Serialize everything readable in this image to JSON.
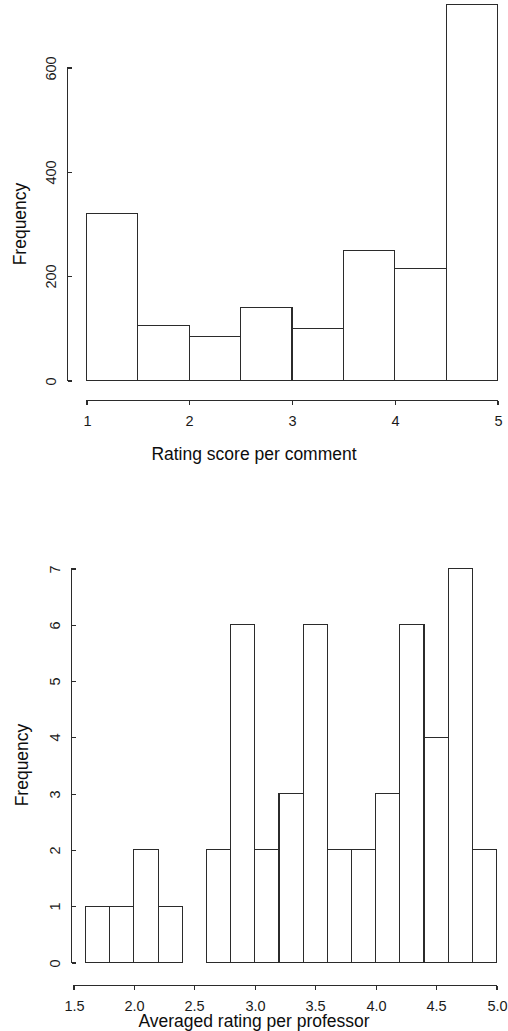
{
  "chart_data": [
    {
      "type": "bar",
      "subtype": "histogram",
      "id": "rating-score-per-comment",
      "title": "",
      "xlabel": "Rating score per comment",
      "ylabel": "Frequency",
      "xlim": [
        1,
        5
      ],
      "ylim": [
        0,
        720
      ],
      "xticks": [
        "1",
        "2",
        "3",
        "4",
        "5"
      ],
      "xtick_values": [
        1,
        2,
        3,
        4,
        5
      ],
      "yticks": [
        "0",
        "200",
        "400",
        "600"
      ],
      "ytick_values": [
        0,
        200,
        400,
        600
      ],
      "grid": false,
      "legend": null,
      "bin_width": 0.5,
      "bin_edges": [
        1.0,
        1.5,
        2.0,
        2.5,
        3.0,
        3.5,
        4.0,
        4.5,
        5.0
      ],
      "categories": [
        "1.0-1.5",
        "1.5-2.0",
        "2.0-2.5",
        "2.5-3.0",
        "3.0-3.5",
        "3.5-4.0",
        "4.0-4.5",
        "4.5-5.0"
      ],
      "values": [
        320,
        105,
        85,
        140,
        100,
        250,
        215,
        720
      ]
    },
    {
      "type": "bar",
      "subtype": "histogram",
      "id": "averaged-rating-per-professor",
      "title": "",
      "xlabel": "Averaged rating per professor",
      "ylabel": "Frequency",
      "xlim": [
        1.5,
        5.0
      ],
      "ylim": [
        0,
        7
      ],
      "xticks": [
        "1.5",
        "2.0",
        "2.5",
        "3.0",
        "3.5",
        "4.0",
        "4.5",
        "5.0"
      ],
      "xtick_values": [
        1.5,
        2.0,
        2.5,
        3.0,
        3.5,
        4.0,
        4.5,
        5.0
      ],
      "yticks": [
        "0",
        "1",
        "2",
        "3",
        "4",
        "5",
        "6",
        "7"
      ],
      "ytick_values": [
        0,
        1,
        2,
        3,
        4,
        5,
        6,
        7
      ],
      "grid": false,
      "legend": null,
      "bin_width": 0.2,
      "bin_edges": [
        1.6,
        1.8,
        2.0,
        2.2,
        2.4,
        2.6,
        2.8,
        3.0,
        3.2,
        3.4,
        3.6,
        3.8,
        4.0,
        4.2,
        4.4,
        4.6,
        4.8,
        5.0
      ],
      "categories": [
        "1.6-1.8",
        "1.8-2.0",
        "2.0-2.2",
        "2.2-2.4",
        "2.4-2.6",
        "2.6-2.8",
        "2.8-3.0",
        "3.0-3.2",
        "3.2-3.4",
        "3.4-3.6",
        "3.6-3.8",
        "3.8-4.0",
        "4.0-4.2",
        "4.2-4.4",
        "4.4-4.6",
        "4.6-4.8",
        "4.8-5.0"
      ],
      "values": [
        1,
        1,
        2,
        1,
        0,
        2,
        6,
        2,
        3,
        6,
        2,
        2,
        3,
        6,
        4,
        7,
        2
      ]
    }
  ],
  "figures": {
    "top": {
      "xlabel": "Rating score per comment",
      "ylabel": "Frequency",
      "xticks": [
        "1",
        "2",
        "3",
        "4",
        "5"
      ],
      "yticks": [
        "0",
        "200",
        "400",
        "600"
      ]
    },
    "bottom": {
      "xlabel": "Averaged rating per professor",
      "ylabel": "Frequency",
      "xticks": [
        "1.5",
        "2.0",
        "2.5",
        "3.0",
        "3.5",
        "4.0",
        "4.5",
        "5.0"
      ],
      "yticks": [
        "0",
        "1",
        "2",
        "3",
        "4",
        "5",
        "6",
        "7"
      ]
    }
  },
  "colors": {
    "background": "#ffffff",
    "ink": "#2b2b2b",
    "text": "#1a1a1a"
  }
}
